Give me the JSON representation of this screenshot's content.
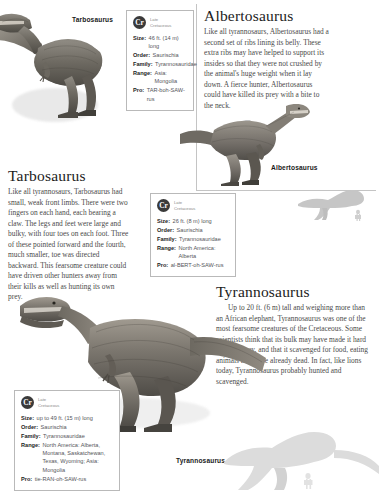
{
  "page": {
    "background": "#ffffff",
    "rule_color": "#c4c4c4"
  },
  "entries": [
    {
      "id": "tarbosaurus",
      "heading": "Tarbosaurus",
      "caption": "Tarbosaurus",
      "body": "Like all tyrannosaurs, Tarbosaurus had small, weak front limbs. There were two fingers on each hand, each bearing a claw. The legs and feet were large and bulky, with four toes on each foot. Three of these pointed forward and the fourth, much smaller, toe was directed backward. This fearsome creature could have driven other hunters away from their kills as well as hunting its own prey.",
      "facts": {
        "era_code": "Cr",
        "era_label": "Late\nCretaceous",
        "size_label": "Size:",
        "size": "46 ft. (14 m) long",
        "order_label": "Order:",
        "order": "Saurischia",
        "family_label": "Family:",
        "family": "Tyrannosauridae",
        "range_label": "Range:",
        "range": "Asia: Mongolia",
        "pro_label": "Pro:",
        "pro": "TAR-boh-SAW-rus"
      }
    },
    {
      "id": "albertosaurus",
      "heading": "Albertosaurus",
      "caption": "Albertosaurus",
      "body": "Like all tyrannosaurs, Albertosaurus had a second set of ribs lining its belly. These extra ribs may have helped to support its insides so that they were not crushed by the animal's huge weight when it lay down. A fierce hunter, Albertosaurus could have killed its prey with a bite to the neck.",
      "facts": {
        "era_code": "Cr",
        "era_label": "Late\nCretaceous",
        "size_label": "Size:",
        "size": "26 ft. (8 m) long",
        "order_label": "Order:",
        "order": "Saurischia",
        "family_label": "Family:",
        "family": "Tyrannosauridae",
        "range_label": "Range:",
        "range": "North America: Alberta",
        "pro_label": "Pro:",
        "pro": "al-BERT-oh-SAW-rus"
      }
    },
    {
      "id": "tyrannosaurus",
      "heading": "Tyrannosaurus",
      "caption": "Tyrannosaurus",
      "body": "Up to 20 ft. (6 m) tall and weighing more than an African elephant, Tyrannosaurus was one of the most fearsome creatures of the Cretaceous. Some scientists think that its bulk may have made it hard to chase prey, and that it scavenged for food, eating animals that were already dead. In fact, like lions today, Tyrannosaurus probably hunted and scavenged.",
      "facts": {
        "era_code": "Cr",
        "era_label": "Late\nCretaceous",
        "size_label": "Size:",
        "size": "up to 49 ft. (15 m) long",
        "order_label": "Order:",
        "order": "Saurischia",
        "family_label": "Family:",
        "family": "Tyrannosauridae",
        "range_label": "Range:",
        "range": "North America: Alberta, Montana, Saskatchewan, Texas, Wyoming; Asia: Mongolia",
        "pro_label": "Pro:",
        "pro": "tie-RAN-oh-SAW-rus"
      }
    }
  ]
}
